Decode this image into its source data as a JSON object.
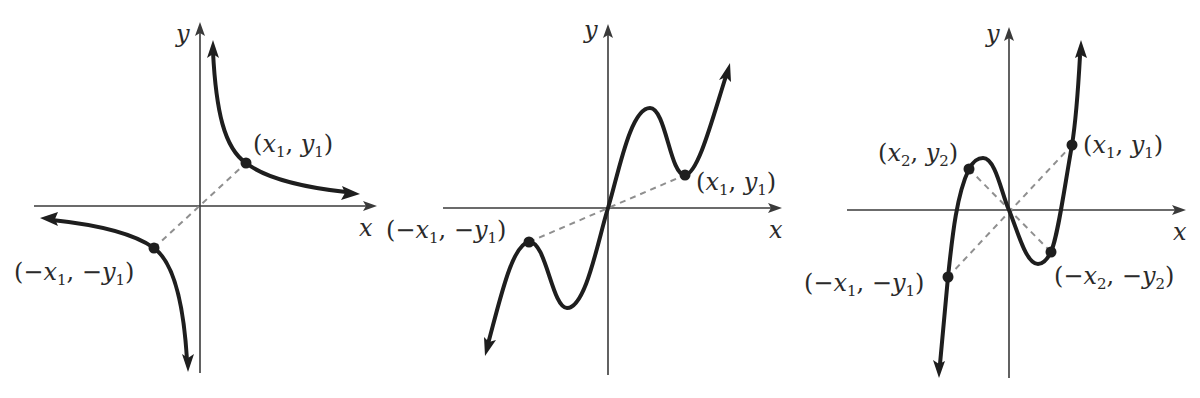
{
  "figure": {
    "colors": {
      "axis": "#3a3a3a",
      "curve": "#1e1e1e",
      "dashed_line": "#8f8f8f",
      "background": "#ffffff"
    },
    "panels": [
      {
        "id": "panel-1",
        "curve_type": "hyperbola (reciprocal-like)",
        "axis_labels": {
          "x": "x",
          "y": "y"
        },
        "points": [
          {
            "name": "p1",
            "label": "(x1, y1)",
            "label_parts": {
              "open": "(",
              "a": "x",
              "a_sub": "1",
              "sep": ", ",
              "b": "y",
              "b_sub": "1",
              "close": ")"
            }
          },
          {
            "name": "p1-neg",
            "label": "(−x1, −y1)",
            "label_parts": {
              "open": "(−",
              "a": "x",
              "a_sub": "1",
              "sep": ", −",
              "b": "y",
              "b_sub": "1",
              "close": ")"
            }
          }
        ]
      },
      {
        "id": "panel-2",
        "curve_type": "wavy odd function",
        "axis_labels": {
          "x": "x",
          "y": "y"
        },
        "points": [
          {
            "name": "p1",
            "label": "(x1, y1)",
            "label_parts": {
              "open": "(",
              "a": "x",
              "a_sub": "1",
              "sep": ", ",
              "b": "y",
              "b_sub": "1",
              "close": ")"
            }
          },
          {
            "name": "p1-neg",
            "label": "(−x1, −y1)",
            "label_parts": {
              "open": "(−",
              "a": "x",
              "a_sub": "1",
              "sep": ", −",
              "b": "y",
              "b_sub": "1",
              "close": ")"
            }
          }
        ]
      },
      {
        "id": "panel-3",
        "curve_type": "cubic odd function",
        "axis_labels": {
          "x": "x",
          "y": "y"
        },
        "points": [
          {
            "name": "p1",
            "label": "(x1, y1)",
            "label_parts": {
              "open": "(",
              "a": "x",
              "a_sub": "1",
              "sep": ", ",
              "b": "y",
              "b_sub": "1",
              "close": ")"
            }
          },
          {
            "name": "p2",
            "label": "(x2, y2)",
            "label_parts": {
              "open": "(",
              "a": "x",
              "a_sub": "2",
              "sep": ", ",
              "b": "y",
              "b_sub": "2",
              "close": ")"
            }
          },
          {
            "name": "p2-neg",
            "label": "(−x2, −y2)",
            "label_parts": {
              "open": "(−",
              "a": "x",
              "a_sub": "2",
              "sep": ", −",
              "b": "y",
              "b_sub": "2",
              "close": ")"
            }
          },
          {
            "name": "p1-neg",
            "label": "(−x1, −y1)",
            "label_parts": {
              "open": "(−",
              "a": "x",
              "a_sub": "1",
              "sep": ", −",
              "b": "y",
              "b_sub": "1",
              "close": ")"
            }
          }
        ]
      }
    ]
  }
}
